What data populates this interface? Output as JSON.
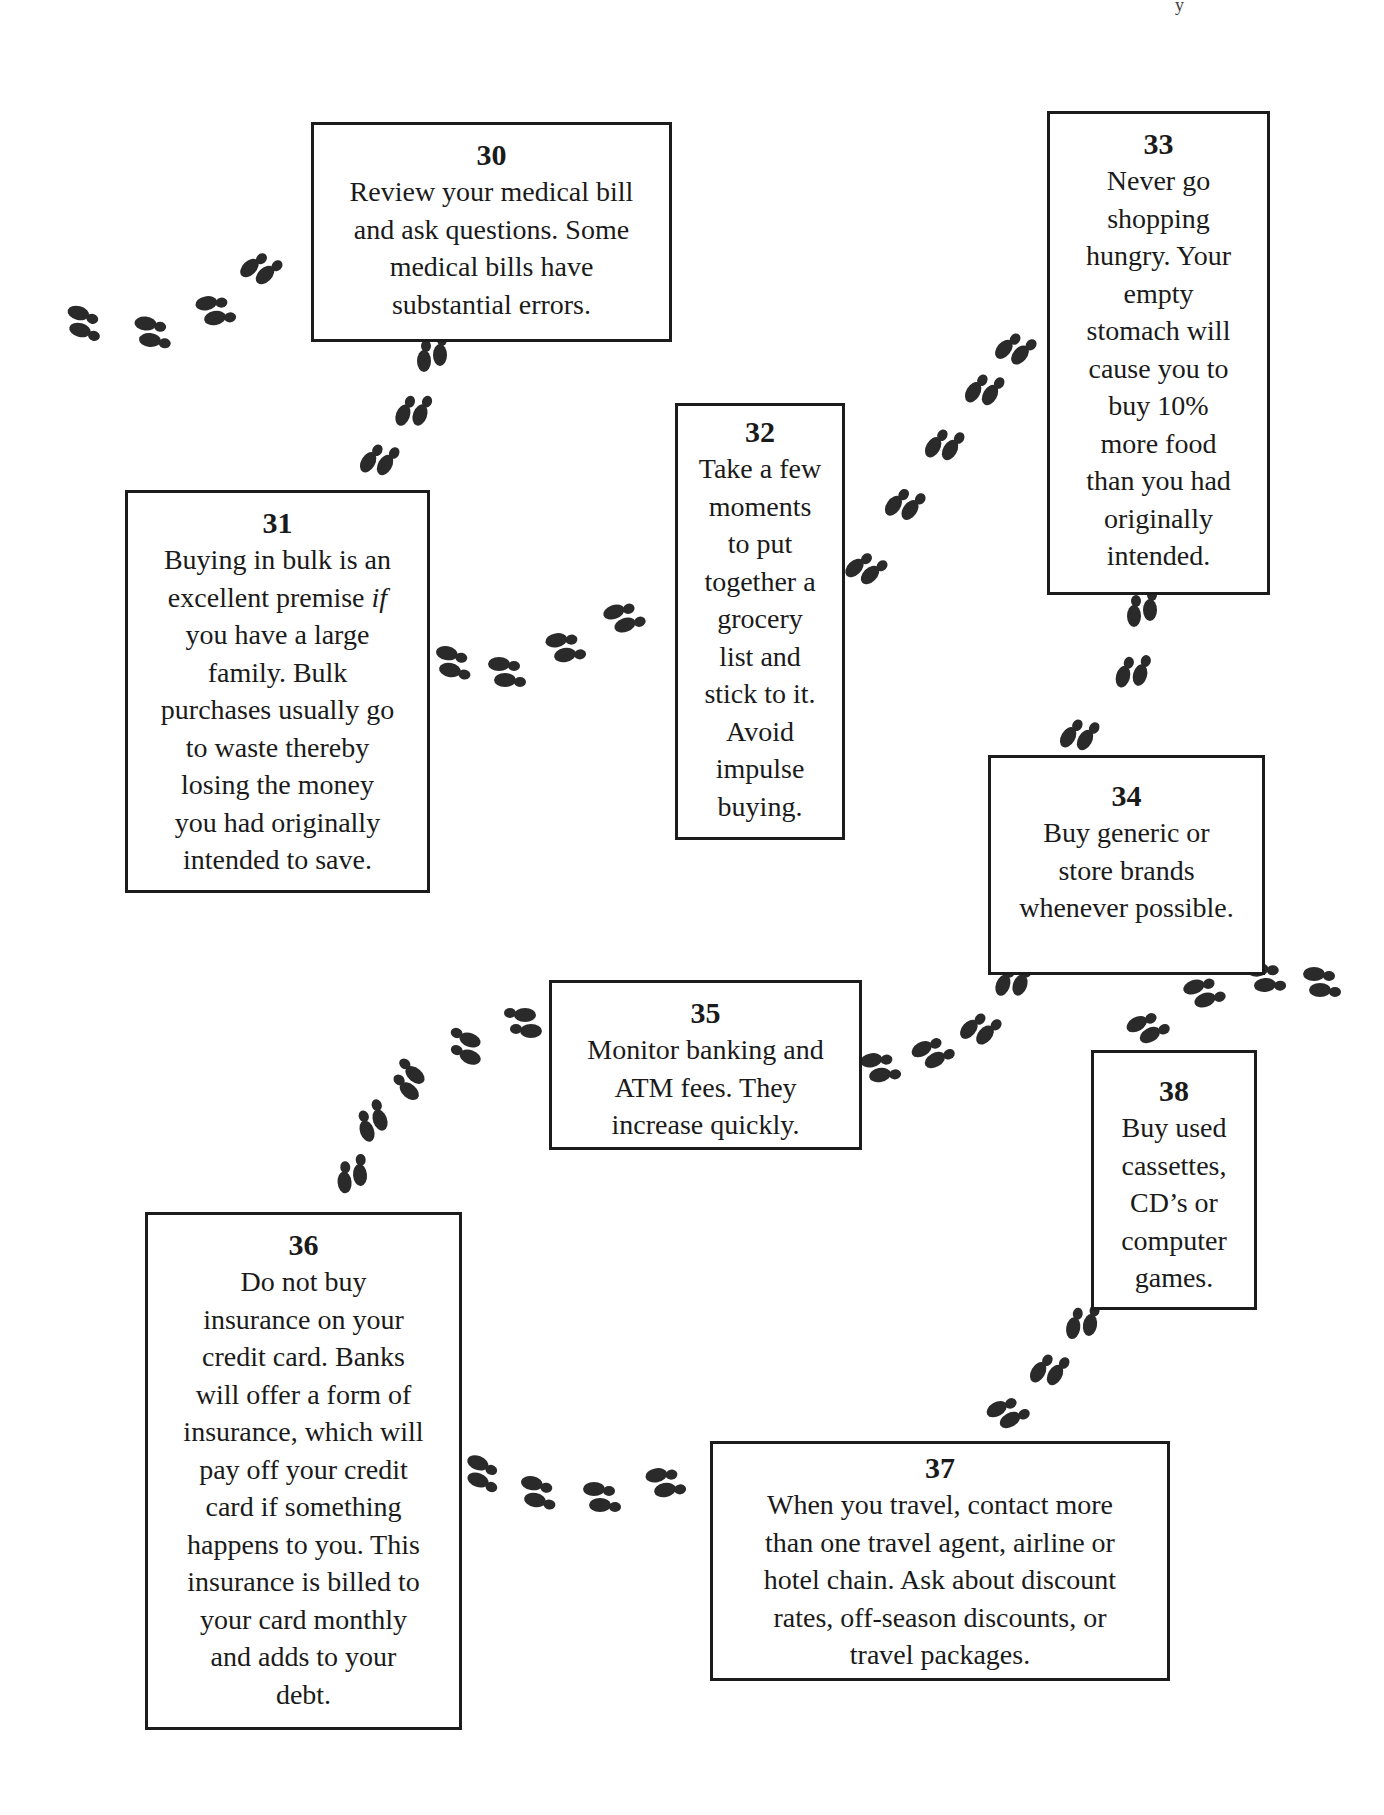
{
  "page": {
    "corner_mark": "y"
  },
  "diagram": {
    "type": "footprint-path of money-saving tips",
    "tips": [
      {
        "number": "30",
        "text": "Review your medical bill\nand ask questions. Some\nmedical bills have\nsubstantial errors.",
        "box": {
          "left": 311,
          "top": 122,
          "width": 361,
          "height": 220
        }
      },
      {
        "number": "31",
        "text_before_italic": "Buying in bulk is an\nexcellent premise ",
        "italic": "if",
        "text_after_italic": "\nyou have a large\nfamily. Bulk\npurchases usually go\nto waste thereby\nlosing the money\nyou had originally\nintended to save.",
        "box": {
          "left": 125,
          "top": 490,
          "width": 305,
          "height": 403
        }
      },
      {
        "number": "32",
        "text": "Take a few\nmoments\nto put\ntogether a\ngrocery\nlist and\nstick to it.\nAvoid\nimpulse\nbuying.",
        "box": {
          "left": 675,
          "top": 403,
          "width": 170,
          "height": 437
        }
      },
      {
        "number": "33",
        "text": "Never go\nshopping\nhungry. Your\nempty\nstomach will\ncause you to\nbuy 10%\nmore food\nthan you had\noriginally\nintended.",
        "box": {
          "left": 1047,
          "top": 111,
          "width": 223,
          "height": 484
        }
      },
      {
        "number": "34",
        "text": "Buy generic or\nstore brands\nwhenever possible.",
        "box": {
          "left": 988,
          "top": 755,
          "width": 277,
          "height": 220
        }
      },
      {
        "number": "35",
        "text": "Monitor banking and\nATM fees. They\nincrease quickly.",
        "box": {
          "left": 549,
          "top": 980,
          "width": 313,
          "height": 170
        }
      },
      {
        "number": "36",
        "text": "Do not buy\ninsurance on your\ncredit card. Banks\nwill offer a form of\ninsurance, which will\npay off your credit\ncard if something\nhappens to you. This\ninsurance is billed to\nyour card monthly\nand adds to your\ndebt.",
        "box": {
          "left": 145,
          "top": 1212,
          "width": 317,
          "height": 518
        }
      },
      {
        "number": "37",
        "text": "When you travel, contact more\nthan one travel agent, airline or\nhotel chain. Ask about discount\nrates, off-season discounts, or\ntravel packages.",
        "box": {
          "left": 710,
          "top": 1441,
          "width": 460,
          "height": 240
        }
      },
      {
        "number": "38",
        "text": "Buy used\ncassettes,\nCD’s or\ncomputer\ngames.",
        "box": {
          "left": 1091,
          "top": 1050,
          "width": 166,
          "height": 260
        }
      }
    ],
    "footprint_trails": [
      {
        "from": "left-edge",
        "to": "30"
      },
      {
        "from": "30",
        "to": "31"
      },
      {
        "from": "31",
        "to": "32"
      },
      {
        "from": "32",
        "to": "33"
      },
      {
        "from": "33",
        "to": "34"
      },
      {
        "from": "34",
        "to": "35"
      },
      {
        "from": "35",
        "to": "36"
      },
      {
        "from": "36",
        "to": "37"
      },
      {
        "from": "37",
        "to": "38"
      },
      {
        "from": "38",
        "to": "right-edge"
      }
    ],
    "colors": {
      "ink": "#1c1c1c",
      "background": "#ffffff",
      "footprint": "#2a2a2a"
    }
  }
}
